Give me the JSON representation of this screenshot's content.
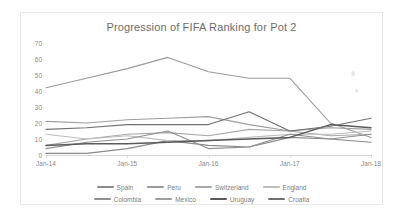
{
  "chart_data": {
    "type": "line",
    "title": "Progression of FIFA Ranking for Pot 2",
    "xlabel": "",
    "ylabel": "",
    "grid": false,
    "legend_position": "bottom",
    "ylim": [
      0,
      70
    ],
    "y_ticks": [
      "0",
      "10",
      "20",
      "30",
      "40",
      "50",
      "60",
      "70"
    ],
    "x_ticks": [
      "Jan-14",
      "Jan-15",
      "Jan-16",
      "Jan-17",
      "Jan-18"
    ],
    "x": [
      "Jan-14",
      "Jul-14",
      "Jan-15",
      "Jul-15",
      "Jan-16",
      "Jul-16",
      "Jan-17",
      "Jul-17",
      "Jan-18"
    ],
    "series": [
      {
        "name": "Spain",
        "color": "#8a8a8a",
        "values": [
          1,
          1,
          4,
          9,
          6,
          5,
          11,
          10,
          8
        ]
      },
      {
        "name": "Peru",
        "color": "#9a9a9a",
        "values": [
          42,
          48,
          54,
          61,
          52,
          48,
          48,
          20,
          11
        ]
      },
      {
        "name": "Switzerland",
        "color": "#a8a8a8",
        "values": [
          6,
          10,
          13,
          14,
          12,
          16,
          15,
          12,
          13
        ]
      },
      {
        "name": "England",
        "color": "#bdbdbd",
        "values": [
          13,
          10,
          12,
          9,
          9,
          11,
          13,
          13,
          15
        ]
      },
      {
        "name": "Colombia",
        "color": "#8f8f8f",
        "values": [
          4,
          8,
          10,
          15,
          4,
          5,
          13,
          10,
          13
        ]
      },
      {
        "name": "Mexico",
        "color": "#9e9e9e",
        "values": [
          21,
          20,
          22,
          23,
          24,
          19,
          15,
          17,
          16
        ]
      },
      {
        "name": "Uruguay",
        "color": "#5a5a5a",
        "values": [
          6,
          7,
          7,
          8,
          9,
          10,
          11,
          19,
          17
        ]
      },
      {
        "name": "Croatia",
        "color": "#707070",
        "values": [
          16,
          17,
          19,
          19,
          19,
          27,
          15,
          18,
          23
        ]
      }
    ]
  }
}
